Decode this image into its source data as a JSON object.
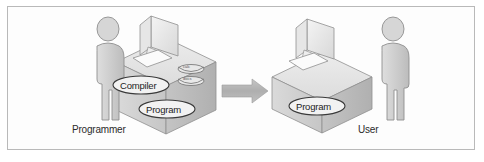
{
  "figure": {
    "border_color": "#b9b9b9",
    "background": "#ffffff"
  },
  "palette": {
    "box_top": "#e3e3e3",
    "box_left": "#d0d0d0",
    "box_right": "#bdbdbd",
    "outline": "#8a8a8a",
    "figure_fill": "#cfcfcf",
    "figure_outline": "#8f8f8f",
    "monitor_fill": "#ededed",
    "arrow_fill": "#b5b5b5",
    "text": "#1d1d1d"
  },
  "left_scene": {
    "person_label": "Programmer",
    "person_icon": "person-silhouette-icon",
    "monitor_icon": "desktop-monitor-icon",
    "keyboard_icon": "keyboard-icon",
    "box_icon": "isometric-box-icon",
    "ellipses": [
      {
        "label": "Compiler",
        "icon": "ellipse-callout-icon"
      },
      {
        "label": "Program",
        "icon": "ellipse-callout-icon"
      }
    ],
    "disks": [
      {
        "label": "calc",
        "icon": "disk-platter-icon"
      },
      {
        "label": "docs",
        "icon": "disk-platter-icon"
      }
    ]
  },
  "arrow": {
    "icon": "right-arrow-icon",
    "direction": "right",
    "color": "#b5b5b5"
  },
  "right_scene": {
    "person_label": "User",
    "person_icon": "person-silhouette-icon",
    "monitor_icon": "desktop-monitor-icon",
    "keyboard_icon": "keyboard-icon",
    "box_icon": "isometric-box-icon",
    "ellipses": [
      {
        "label": "Program",
        "icon": "ellipse-callout-icon"
      }
    ]
  }
}
